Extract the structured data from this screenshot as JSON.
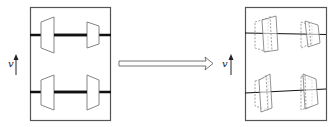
{
  "diagram": {
    "colors": {
      "frame": "#555555",
      "axle": "#111111",
      "wheel": "#777777",
      "arrow": "#666666"
    },
    "left_panel": {
      "label": "v",
      "direction": "up",
      "state": "initial"
    },
    "transition_arrow": {
      "direction": "right"
    },
    "right_panel": {
      "label": "v",
      "direction": "up",
      "state": "displaced",
      "ghost_outline": "dashed"
    }
  }
}
